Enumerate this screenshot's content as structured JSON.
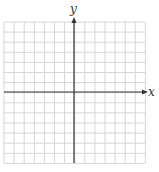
{
  "diagram": {
    "type": "coordinate-plane",
    "x_axis_label": "x",
    "y_axis_label": "y",
    "grid": {
      "columns": 14,
      "rows": 14,
      "left": 4,
      "top": 22,
      "cell": 10.1,
      "line_color": "#d6d6d6"
    },
    "axes": {
      "color": "#333333",
      "origin_x": 74,
      "origin_y": 92,
      "x_axis_start": 4,
      "x_axis_end": 148,
      "y_axis_top": 17,
      "y_axis_bottom": 163
    }
  }
}
